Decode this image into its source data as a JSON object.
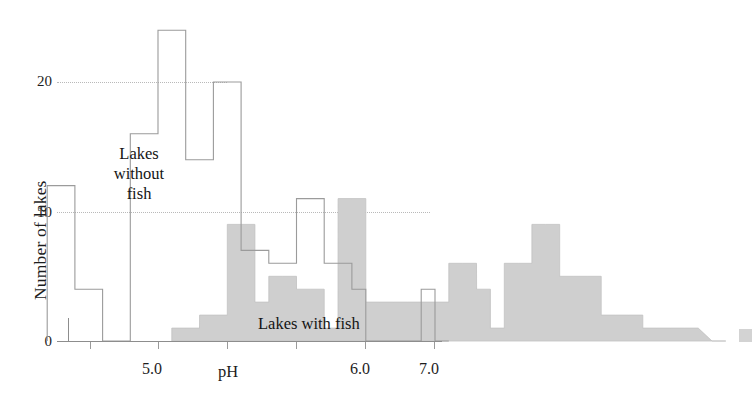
{
  "chart_data": {
    "type": "bar",
    "title": "",
    "xlabel": "pH",
    "ylabel": "Number of lakes",
    "xlim": [
      4.55,
      7.15
    ],
    "ylim": [
      0,
      25
    ],
    "grid": "dotted horizontal reference lines at y=10 and y=20",
    "bin_width": 0.05,
    "x_ticks": [
      4.75,
      5.0,
      5.25,
      5.5,
      5.75,
      6.0,
      6.25,
      6.5,
      6.75,
      7.0
    ],
    "x_tick_labels": [
      "",
      "5.0",
      "",
      "",
      "",
      "6.0",
      "",
      "",
      "",
      "7.0"
    ],
    "y_ticks": [
      0,
      10,
      20
    ],
    "y_tick_labels": [
      "0",
      "10",
      "20"
    ],
    "legend_position": "inline annotations",
    "series": [
      {
        "name": "Lakes without fish",
        "style": "open outline",
        "color": "#8d8d8d",
        "bin_starts": [
          4.6,
          4.65,
          4.7,
          4.75,
          4.8,
          4.85,
          4.9,
          4.95,
          5.0,
          5.05,
          5.1,
          5.15,
          5.2,
          5.25,
          5.3,
          5.35,
          5.4,
          5.45,
          5.5,
          5.55,
          5.6,
          5.65,
          5.7,
          5.75,
          5.8,
          5.85,
          5.9,
          5.95,
          6.0
        ],
        "values": [
          12,
          12,
          4,
          4,
          0,
          0,
          16,
          16,
          24,
          24,
          14,
          14,
          20,
          20,
          7,
          7,
          6,
          6,
          11,
          11,
          6,
          6,
          4,
          0,
          0,
          0,
          0,
          4,
          0
        ]
      },
      {
        "name": "Lakes with fish",
        "style": "filled",
        "color": "#cfcfcf",
        "bin_starts": [
          5.05,
          5.1,
          5.15,
          5.2,
          5.25,
          5.3,
          5.35,
          5.4,
          5.45,
          5.5,
          5.55,
          5.6,
          5.65,
          5.7,
          5.75,
          5.8,
          5.85,
          5.9,
          5.95,
          6.0,
          6.05,
          6.1,
          6.15,
          6.2,
          6.25,
          6.3,
          6.35,
          6.4,
          6.45,
          6.5,
          6.55,
          6.6,
          6.65,
          6.7,
          6.75,
          6.8,
          6.85,
          6.9,
          7.0
        ],
        "values": [
          1,
          1,
          2,
          2,
          9,
          9,
          3,
          5,
          5,
          4,
          4,
          1,
          11,
          11,
          3,
          3,
          3,
          3,
          3,
          3,
          6,
          6,
          4,
          1,
          6,
          6,
          9,
          9,
          5,
          5,
          5,
          2,
          2,
          2,
          1,
          1,
          1,
          1,
          0
        ]
      }
    ],
    "annotations": [
      {
        "name": "lakes-without-fish-label",
        "text_lines": [
          "Lakes",
          "without",
          "fish"
        ],
        "x": 5.02,
        "y": 14
      },
      {
        "name": "lakes-with-fish-label",
        "text_lines": [
          "Lakes with fish"
        ],
        "x": 6.25,
        "y": 2
      }
    ],
    "outlier_marker": {
      "name": "outlier-marker",
      "x": 7.12,
      "value": 1,
      "color": "#d3d3d3"
    }
  },
  "axis": {
    "y_title": "Number of lakes",
    "x_title": "pH",
    "y_ticks": [
      "20",
      "10",
      "0"
    ],
    "x_ticks": [
      "5.0",
      "6.0",
      "7.0"
    ]
  },
  "annotations": {
    "without_fish_line1": "Lakes",
    "without_fish_line2": "without",
    "without_fish_line3": "fish",
    "with_fish": "Lakes with fish"
  }
}
